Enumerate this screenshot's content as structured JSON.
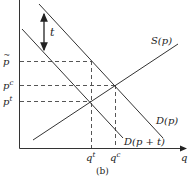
{
  "diagram": {
    "caption": "(b)",
    "axes": {
      "x_label": "q",
      "y_labels": {
        "p_tilde": "p̃",
        "p_c": "pc",
        "p_t": "pt"
      },
      "x_ticks": {
        "q_t": "qt",
        "q_c": "qc"
      }
    },
    "curves": {
      "supply": "S(p)",
      "demand": "D(p)",
      "demand_shifted": "D(p + t)"
    },
    "annotation": {
      "tax_gap": "t"
    },
    "colors": {
      "line": "#333333",
      "dashed": "#555555"
    }
  }
}
